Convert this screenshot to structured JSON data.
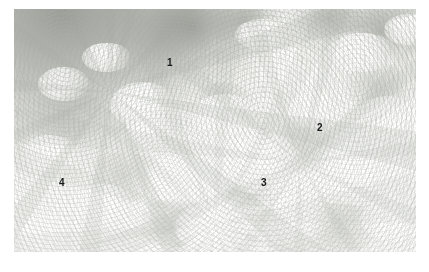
{
  "figure": {
    "kind": "photograph",
    "plate": {
      "left": 14,
      "top": 9,
      "width": 402,
      "height": 243
    },
    "page_background": "#ffffff",
    "tone": {
      "overall": "high-key washed out monochrome-leaning photograph",
      "highlight": "#ffffff",
      "midtone": "#f2f2f0",
      "shadow": "#86887f",
      "label_color": "#17181a"
    }
  },
  "annotations": [
    {
      "id": "annotation-1",
      "label": "1",
      "x": 167,
      "y": 58,
      "target": "upright leafy stem, upper centre"
    },
    {
      "id": "annotation-2",
      "label": "2",
      "x": 317,
      "y": 123,
      "target": "tall flowering spike, right of centre"
    },
    {
      "id": "annotation-3",
      "label": "3",
      "x": 261,
      "y": 178,
      "target": "rounded flower head, lower centre"
    },
    {
      "id": "annotation-4",
      "label": "4",
      "x": 59,
      "y": 178,
      "target": "low massed blooms, left foreground"
    }
  ],
  "regions": [
    {
      "id": "dark-upper-left",
      "description": "out-of-focus dark background mass in the upper left corner"
    },
    {
      "id": "dark-upper-right",
      "description": "darker broad leaves across the top edge and upper right"
    },
    {
      "id": "bloom-field",
      "description": "overexposed white flower heads filling the centre, right and lower areas"
    }
  ]
}
